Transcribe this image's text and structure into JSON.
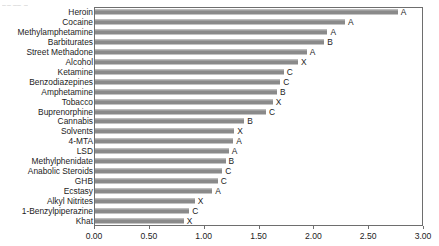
{
  "artifact_text": "▁▁ ▁▁ ▁",
  "chart_data": {
    "type": "bar",
    "orientation": "horizontal",
    "title": "",
    "subtitle": "",
    "xlabel": "",
    "ylabel": "",
    "xlim": [
      0.0,
      3.0
    ],
    "xticks": [
      0.0,
      0.5,
      1.0,
      1.5,
      2.0,
      2.5,
      3.0
    ],
    "xtick_labels": [
      "0.00",
      "0.50",
      "1.00",
      "1.50",
      "2.00",
      "2.50",
      "3.00"
    ],
    "grid": false,
    "legend": "none",
    "bar_color": "#8a8a8a",
    "categories": [
      "Heroin",
      "Cocaine",
      "Methylamphetamine",
      "Barbiturates",
      "Street Methadone",
      "Alcohol",
      "Ketamine",
      "Benzodiazepines",
      "Amphetamine",
      "Tobacco",
      "Buprenorphine",
      "Cannabis",
      "Solvents",
      "4-MTA",
      "LSD",
      "Methylphenidate",
      "Anabolic Steroids",
      "GHB",
      "Ecstasy",
      "Alkyl Nitrites",
      "1-Benzylpiperazine",
      "Khat"
    ],
    "values": [
      2.76,
      2.28,
      2.12,
      2.09,
      1.93,
      1.85,
      1.72,
      1.69,
      1.66,
      1.62,
      1.56,
      1.36,
      1.27,
      1.26,
      1.22,
      1.19,
      1.16,
      1.12,
      1.07,
      0.91,
      0.86,
      0.81
    ],
    "point_labels": [
      "A",
      "A",
      "A",
      "B",
      "A",
      "X",
      "C",
      "C",
      "B",
      "X",
      "C",
      "B",
      "X",
      "A",
      "A",
      "B",
      "C",
      "C",
      "A",
      "X",
      "C",
      "X"
    ]
  }
}
